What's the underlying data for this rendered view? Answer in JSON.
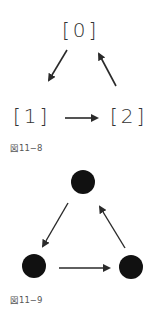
{
  "figure_a": {
    "nodes": [
      {
        "label": "[0]"
      },
      {
        "label": "[1]"
      },
      {
        "label": "[2]"
      }
    ],
    "edges": [
      {
        "from": "[0]",
        "to": "[1]"
      },
      {
        "from": "[1]",
        "to": "[2]"
      },
      {
        "from": "[2]",
        "to": "[0]"
      }
    ],
    "caption": "図11−8"
  },
  "figure_b": {
    "nodes": [
      {
        "shape": "filled-circle"
      },
      {
        "shape": "filled-circle"
      },
      {
        "shape": "filled-circle"
      }
    ],
    "edges": [
      {
        "from": "top",
        "to": "bottom-left"
      },
      {
        "from": "bottom-left",
        "to": "bottom-right"
      },
      {
        "from": "bottom-right",
        "to": "top"
      }
    ],
    "caption": "図11−9"
  },
  "colors": {
    "ink": "#2a2a2a",
    "node_fill": "#111111",
    "caption": "#555555"
  }
}
